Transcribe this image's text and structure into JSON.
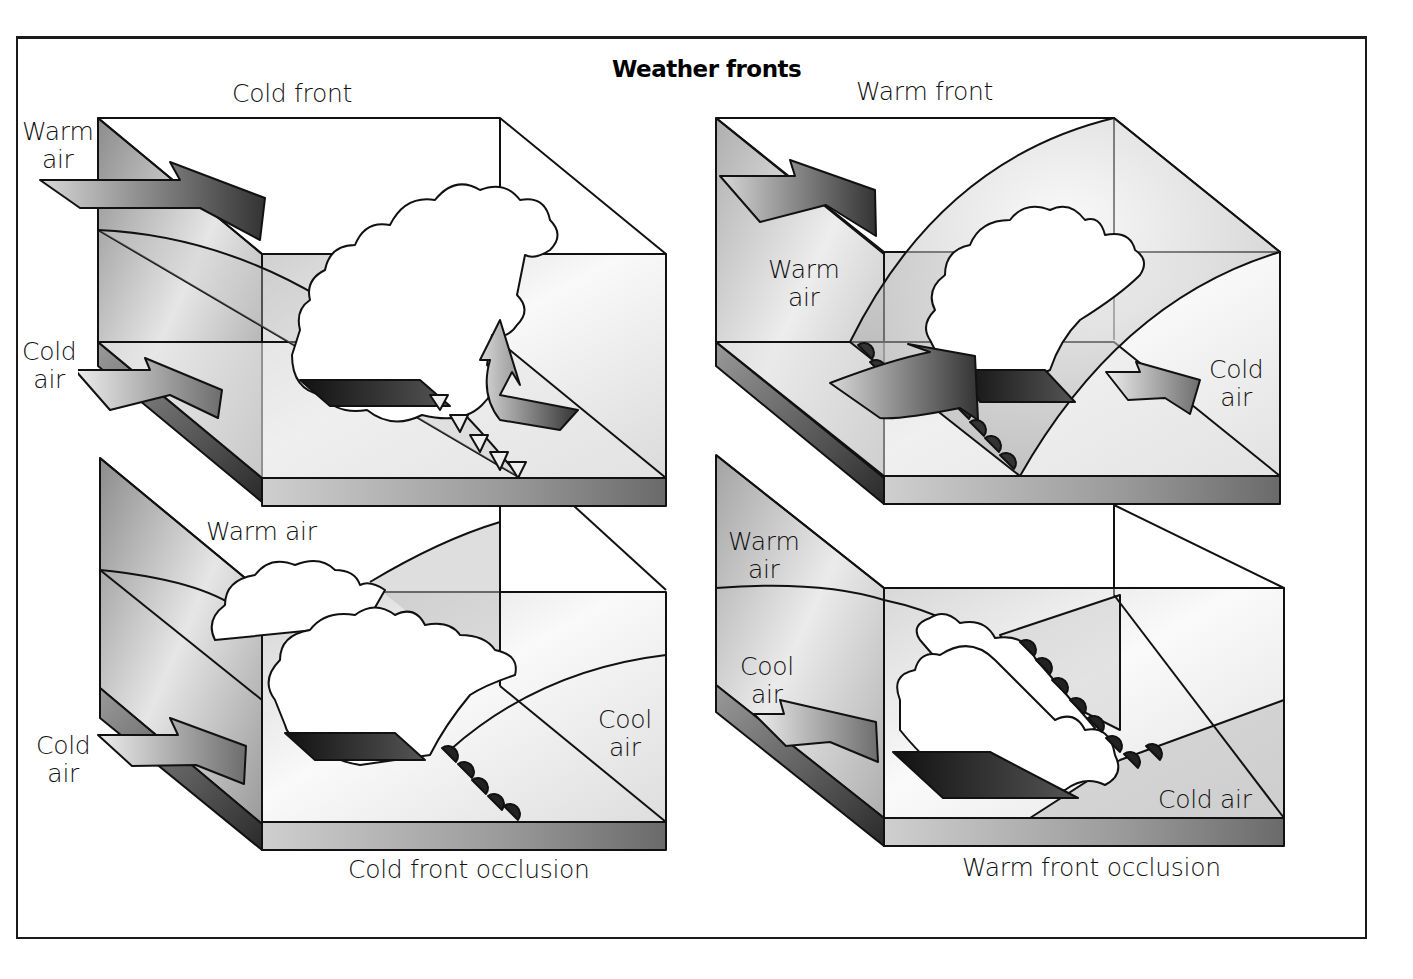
{
  "title": "Weather fronts",
  "colors": {
    "line": "#111111",
    "light_fill": "#f2f2f2",
    "mid_fill": "#b8b8b8",
    "dark_fill": "#5a5a5a",
    "front_symbol": "#1a1a1a",
    "background": "#ffffff"
  },
  "panels": [
    {
      "id": "cold-front",
      "caption": "Cold front",
      "labels": [
        {
          "text": "Warm\nair",
          "line1": "Warm",
          "line2": "air"
        },
        {
          "text": "Cold\nair",
          "line1": "Cold",
          "line2": "air"
        }
      ],
      "front_symbol": "triangles"
    },
    {
      "id": "warm-front",
      "caption": "Warm front",
      "labels": [
        {
          "text": "Warm\nair",
          "line1": "Warm",
          "line2": "air"
        },
        {
          "text": "Cold\nair",
          "line1": "Cold",
          "line2": "air"
        }
      ],
      "front_symbol": "semicircles"
    },
    {
      "id": "cold-front-occlusion",
      "caption": "Cold front occlusion",
      "labels": [
        {
          "text": "Warm air",
          "line1": "Warm air"
        },
        {
          "text": "Cold\nair",
          "line1": "Cold",
          "line2": "air"
        },
        {
          "text": "Cool\nair",
          "line1": "Cool",
          "line2": "air"
        }
      ],
      "front_symbol": "triangles-and-semicircles"
    },
    {
      "id": "warm-front-occlusion",
      "caption": "Warm front occlusion",
      "labels": [
        {
          "text": "Warm\nair",
          "line1": "Warm",
          "line2": "air"
        },
        {
          "text": "Cool\nair",
          "line1": "Cool",
          "line2": "air"
        },
        {
          "text": "Cold air",
          "line1": "Cold air"
        }
      ],
      "front_symbol": "semicircles"
    }
  ]
}
